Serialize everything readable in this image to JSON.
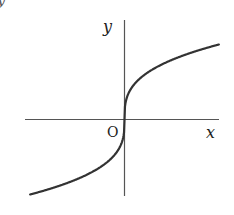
{
  "figure": {
    "corner_fragment": "y",
    "labels": {
      "x_axis": "x",
      "y_axis": "y",
      "origin": "O"
    },
    "colors": {
      "axis": "#555555",
      "curve": "#333333",
      "text": "#222222",
      "background": "#ffffff"
    }
  },
  "chart_data": {
    "type": "line",
    "title": "",
    "xlabel": "x",
    "ylabel": "y",
    "origin_label": "O",
    "grid": false,
    "legend": null,
    "series": [
      {
        "name": "y = x^(1/3)",
        "x": [
          -8,
          -6,
          -4,
          -2,
          -1,
          -0.5,
          -0.1,
          0,
          0.1,
          0.5,
          1,
          2,
          4,
          6,
          8
        ],
        "values": [
          -2,
          -1.817,
          -1.587,
          -1.26,
          -1,
          -0.794,
          -0.464,
          0,
          0.464,
          0.794,
          1,
          1.26,
          1.587,
          1.817,
          2
        ]
      }
    ],
    "xlim": [
      -8.5,
      8.5
    ],
    "ylim": [
      -2.2,
      2.8
    ],
    "ticks": {
      "x": [],
      "y": []
    }
  }
}
